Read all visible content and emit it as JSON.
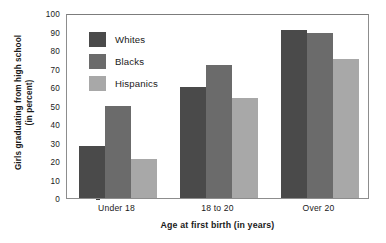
{
  "chart_data": {
    "type": "bar",
    "title": "",
    "xlabel": "Age at first birth (in years)",
    "ylabel": "Girls graduating from high school (in percent)",
    "ylabel_lines": [
      "Girls graduating from high school",
      "(in percent)"
    ],
    "categories": [
      "Under 18",
      "18 to 20",
      "Over 20"
    ],
    "series": [
      {
        "name": "Whites",
        "color": "#4a4a4a",
        "values": [
          28,
          60,
          91
        ]
      },
      {
        "name": "Blacks",
        "color": "#6b6b6b",
        "values": [
          50,
          72,
          89
        ]
      },
      {
        "name": "Hispanics",
        "color": "#a8a8a8",
        "values": [
          21,
          54,
          75
        ]
      }
    ],
    "ylim": [
      0,
      100
    ],
    "ytick_step": 10,
    "yticks": [
      0,
      10,
      20,
      30,
      40,
      50,
      60,
      70,
      80,
      90,
      100
    ],
    "ytick_labels": [
      "0",
      "10",
      "20",
      "30",
      "40",
      "50",
      "60",
      "70",
      "80",
      "90",
      "100"
    ],
    "grid": false,
    "legend_position": "top-left-inside",
    "frame": true
  }
}
